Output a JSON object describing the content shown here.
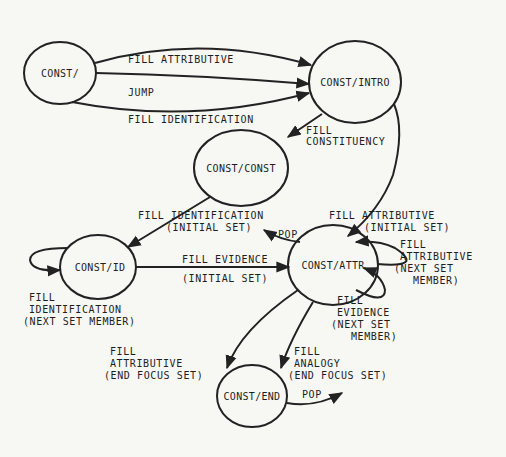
{
  "diagram": {
    "type": "state-transition-network",
    "colors": {
      "background": "#f7f7f4",
      "ink": "#222222"
    },
    "nodes": [
      {
        "id": "const",
        "label": "CONST/",
        "cx": 60,
        "cy": 73,
        "rx": 36,
        "ry": 31
      },
      {
        "id": "const_intro",
        "label": "CONST/INTRO",
        "cx": 355,
        "cy": 82,
        "rx": 46,
        "ry": 41
      },
      {
        "id": "const_const",
        "label": "CONST/CONST",
        "cx": 241,
        "cy": 168,
        "rx": 47,
        "ry": 38
      },
      {
        "id": "const_id",
        "label": "CONST/ID",
        "cx": 98,
        "cy": 267,
        "rx": 38,
        "ry": 32
      },
      {
        "id": "const_attr",
        "label": "CONST/ATTR",
        "cx": 333,
        "cy": 265,
        "rx": 45,
        "ry": 40
      },
      {
        "id": "const_end",
        "label": "CONST/END",
        "cx": 252,
        "cy": 396,
        "rx": 35,
        "ry": 31
      }
    ],
    "edges": [
      {
        "from": "const",
        "to": "const_intro",
        "label": [
          "FILL ATTRIBUTIVE"
        ]
      },
      {
        "from": "const",
        "to": "const_intro",
        "label": [
          "JUMP"
        ]
      },
      {
        "from": "const",
        "to": "const_intro",
        "label": [
          "FILL IDENTIFICATION"
        ]
      },
      {
        "from": "const_intro",
        "to": "const_const",
        "label": [
          "FILL",
          "CONSTITUENCY"
        ]
      },
      {
        "from": "const_intro",
        "to": "const_attr",
        "label": [
          "FILL ATTRIBUTIVE",
          "(INITIAL SET)"
        ]
      },
      {
        "from": "const_const",
        "to": "const_id",
        "label": [
          "FILL IDENTIFICATION",
          "(INITIAL SET)"
        ]
      },
      {
        "from": "const_attr",
        "to": "const_const",
        "label": [
          "POP"
        ]
      },
      {
        "from": "const_id",
        "to": "const_id",
        "label": [
          "FILL",
          "IDENTIFICATION",
          "(NEXT SET MEMBER)"
        ]
      },
      {
        "from": "const_id",
        "to": "const_attr",
        "label": [
          "FILL EVIDENCE",
          "(INITIAL SET)"
        ]
      },
      {
        "from": "const_attr",
        "to": "const_attr",
        "label": [
          "FILL",
          "ATTRIBUTIVE",
          "(NEXT SET",
          "MEMBER)"
        ]
      },
      {
        "from": "const_attr",
        "to": "const_attr",
        "label": [
          "FILL",
          "EVIDENCE",
          "(NEXT SET",
          "MEMBER)"
        ]
      },
      {
        "from": "const_attr",
        "to": "const_end",
        "label": [
          "FILL",
          "ATTRIBUTIVE",
          "(END FOCUS SET)"
        ]
      },
      {
        "from": "const_attr",
        "to": "const_end",
        "label": [
          "FILL",
          "ANALOGY",
          "(END FOCUS SET)"
        ]
      },
      {
        "from": "const_end",
        "to": null,
        "label": [
          "POP"
        ]
      }
    ]
  }
}
